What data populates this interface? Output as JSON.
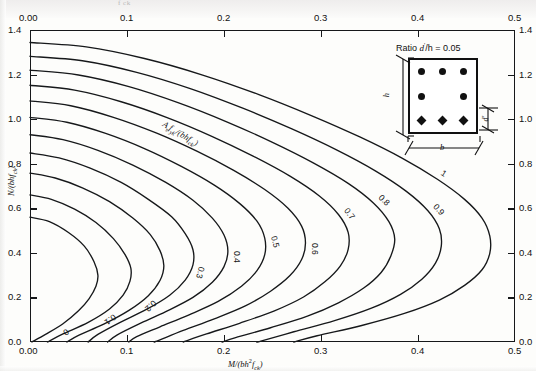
{
  "page": {
    "cut_off_text_top": "f ck"
  },
  "chart_data": {
    "type": "line",
    "title": "",
    "xlabel": "M/(bh²f_ck)",
    "ylabel": "N/(bhf_ck)",
    "xlim": [
      0.0,
      0.5
    ],
    "ylim": [
      0.0,
      1.4
    ],
    "grid": false,
    "legend_position": "inline-curve-labels",
    "x_ticks_bottom": [
      "0.00",
      "0.1",
      "0.2",
      "0.3",
      "0.4",
      "0.5"
    ],
    "x_ticks_top": [
      "0.00",
      "0.1",
      "0.2",
      "0.3",
      "0.4",
      "0.5"
    ],
    "y_ticks_left": [
      "0.0",
      "0.2",
      "0.4",
      "0.6",
      "0.8",
      "1.0",
      "1.2",
      "1.4"
    ],
    "y_ticks_right": [
      "0.0",
      "0.2",
      "0.4",
      "0.6",
      "0.8",
      "1.0",
      "1.2",
      "1.4"
    ],
    "x_tick_values": [
      0.0,
      0.1,
      0.2,
      0.3,
      0.4,
      0.5
    ],
    "y_tick_values": [
      0.0,
      0.2,
      0.4,
      0.6,
      0.8,
      1.0,
      1.2,
      1.4
    ],
    "series_parameter_label": "Asfyk/(bhfck)",
    "series": [
      {
        "name": "0",
        "label": "0",
        "points": [
          [
            0.0,
            0.56
          ],
          [
            0.02,
            0.54
          ],
          [
            0.04,
            0.49
          ],
          [
            0.056,
            0.43
          ],
          [
            0.066,
            0.36
          ],
          [
            0.07,
            0.3
          ],
          [
            0.068,
            0.25
          ],
          [
            0.061,
            0.195
          ],
          [
            0.05,
            0.14
          ],
          [
            0.034,
            0.082
          ],
          [
            0.016,
            0.034
          ],
          [
            0.002,
            0.0
          ]
        ]
      },
      {
        "name": "0.1",
        "label": "0.1",
        "points": [
          [
            0.0,
            0.66
          ],
          [
            0.022,
            0.64
          ],
          [
            0.046,
            0.596
          ],
          [
            0.068,
            0.536
          ],
          [
            0.086,
            0.464
          ],
          [
            0.098,
            0.392
          ],
          [
            0.104,
            0.33
          ],
          [
            0.103,
            0.272
          ],
          [
            0.096,
            0.21
          ],
          [
            0.082,
            0.148
          ],
          [
            0.06,
            0.088
          ],
          [
            0.034,
            0.036
          ],
          [
            0.018,
            0.0
          ]
        ]
      },
      {
        "name": "0.2",
        "label": "0.2",
        "points": [
          [
            0.0,
            0.758
          ],
          [
            0.026,
            0.736
          ],
          [
            0.054,
            0.692
          ],
          [
            0.082,
            0.63
          ],
          [
            0.106,
            0.556
          ],
          [
            0.124,
            0.482
          ],
          [
            0.134,
            0.41
          ],
          [
            0.138,
            0.342
          ],
          [
            0.134,
            0.276
          ],
          [
            0.122,
            0.208
          ],
          [
            0.102,
            0.142
          ],
          [
            0.076,
            0.08
          ],
          [
            0.05,
            0.03
          ],
          [
            0.038,
            0.0
          ]
        ]
      },
      {
        "name": "0.3",
        "label": "0.3",
        "points": [
          [
            0.0,
            0.848
          ],
          [
            0.03,
            0.826
          ],
          [
            0.062,
            0.78
          ],
          [
            0.094,
            0.716
          ],
          [
            0.122,
            0.64
          ],
          [
            0.146,
            0.562
          ],
          [
            0.16,
            0.486
          ],
          [
            0.168,
            0.414
          ],
          [
            0.168,
            0.346
          ],
          [
            0.16,
            0.278
          ],
          [
            0.144,
            0.21
          ],
          [
            0.12,
            0.146
          ],
          [
            0.092,
            0.086
          ],
          [
            0.07,
            0.034
          ],
          [
            0.06,
            0.0
          ]
        ]
      },
      {
        "name": "0.4",
        "label": "0.4",
        "points": [
          [
            0.0,
            0.93
          ],
          [
            0.034,
            0.908
          ],
          [
            0.07,
            0.86
          ],
          [
            0.106,
            0.794
          ],
          [
            0.14,
            0.716
          ],
          [
            0.168,
            0.636
          ],
          [
            0.188,
            0.556
          ],
          [
            0.2,
            0.48
          ],
          [
            0.204,
            0.408
          ],
          [
            0.2,
            0.338
          ],
          [
            0.188,
            0.268
          ],
          [
            0.168,
            0.2
          ],
          [
            0.14,
            0.136
          ],
          [
            0.112,
            0.08
          ],
          [
            0.09,
            0.032
          ],
          [
            0.08,
            0.0
          ]
        ]
      },
      {
        "name": "0.5",
        "label": "0.5",
        "points": [
          [
            0.0,
            1.008
          ],
          [
            0.038,
            0.986
          ],
          [
            0.078,
            0.936
          ],
          [
            0.118,
            0.868
          ],
          [
            0.156,
            0.788
          ],
          [
            0.19,
            0.704
          ],
          [
            0.216,
            0.622
          ],
          [
            0.234,
            0.542
          ],
          [
            0.242,
            0.466
          ],
          [
            0.242,
            0.392
          ],
          [
            0.234,
            0.32
          ],
          [
            0.218,
            0.25
          ],
          [
            0.194,
            0.182
          ],
          [
            0.164,
            0.122
          ],
          [
            0.134,
            0.068
          ],
          [
            0.11,
            0.024
          ],
          [
            0.102,
            0.0
          ]
        ]
      },
      {
        "name": "0.6",
        "label": "0.6",
        "points": [
          [
            0.0,
            1.082
          ],
          [
            0.042,
            1.06
          ],
          [
            0.086,
            1.008
          ],
          [
            0.13,
            0.938
          ],
          [
            0.172,
            0.856
          ],
          [
            0.21,
            0.77
          ],
          [
            0.242,
            0.684
          ],
          [
            0.266,
            0.6
          ],
          [
            0.28,
            0.52
          ],
          [
            0.284,
            0.444
          ],
          [
            0.28,
            0.37
          ],
          [
            0.268,
            0.298
          ],
          [
            0.248,
            0.228
          ],
          [
            0.222,
            0.162
          ],
          [
            0.19,
            0.104
          ],
          [
            0.158,
            0.052
          ],
          [
            0.134,
            0.01
          ],
          [
            0.128,
            0.0
          ]
        ]
      },
      {
        "name": "0.7",
        "label": "0.7",
        "points": [
          [
            0.0,
            1.152
          ],
          [
            0.046,
            1.13
          ],
          [
            0.094,
            1.078
          ],
          [
            0.142,
            1.006
          ],
          [
            0.188,
            0.922
          ],
          [
            0.23,
            0.834
          ],
          [
            0.268,
            0.744
          ],
          [
            0.298,
            0.656
          ],
          [
            0.318,
            0.572
          ],
          [
            0.328,
            0.492
          ],
          [
            0.328,
            0.416
          ],
          [
            0.32,
            0.342
          ],
          [
            0.304,
            0.27
          ],
          [
            0.282,
            0.202
          ],
          [
            0.252,
            0.14
          ],
          [
            0.216,
            0.084
          ],
          [
            0.182,
            0.036
          ],
          [
            0.158,
            0.0
          ]
        ]
      },
      {
        "name": "0.8",
        "label": "0.8",
        "points": [
          [
            0.0,
            1.22
          ],
          [
            0.05,
            1.198
          ],
          [
            0.102,
            1.146
          ],
          [
            0.154,
            1.072
          ],
          [
            0.204,
            0.986
          ],
          [
            0.25,
            0.896
          ],
          [
            0.292,
            0.804
          ],
          [
            0.328,
            0.712
          ],
          [
            0.354,
            0.624
          ],
          [
            0.37,
            0.54
          ],
          [
            0.376,
            0.462
          ],
          [
            0.372,
            0.386
          ],
          [
            0.362,
            0.312
          ],
          [
            0.344,
            0.242
          ],
          [
            0.318,
            0.176
          ],
          [
            0.286,
            0.116
          ],
          [
            0.248,
            0.064
          ],
          [
            0.212,
            0.02
          ],
          [
            0.198,
            0.0
          ]
        ]
      },
      {
        "name": "0.9",
        "label": "0.9",
        "points": [
          [
            0.0,
            1.282
          ],
          [
            0.054,
            1.262
          ],
          [
            0.11,
            1.21
          ],
          [
            0.166,
            1.136
          ],
          [
            0.22,
            1.048
          ],
          [
            0.27,
            0.956
          ],
          [
            0.316,
            0.862
          ],
          [
            0.356,
            0.768
          ],
          [
            0.388,
            0.676
          ],
          [
            0.41,
            0.59
          ],
          [
            0.422,
            0.508
          ],
          [
            0.424,
            0.43
          ],
          [
            0.418,
            0.354
          ],
          [
            0.404,
            0.282
          ],
          [
            0.382,
            0.214
          ],
          [
            0.352,
            0.152
          ],
          [
            0.314,
            0.096
          ],
          [
            0.272,
            0.046
          ],
          [
            0.238,
            0.004
          ],
          [
            0.234,
            0.0
          ]
        ]
      },
      {
        "name": "1",
        "label": "1",
        "points": [
          [
            0.0,
            1.344
          ],
          [
            0.058,
            1.324
          ],
          [
            0.118,
            1.272
          ],
          [
            0.178,
            1.198
          ],
          [
            0.236,
            1.11
          ],
          [
            0.29,
            1.016
          ],
          [
            0.34,
            0.92
          ],
          [
            0.384,
            0.824
          ],
          [
            0.42,
            0.73
          ],
          [
            0.448,
            0.64
          ],
          [
            0.466,
            0.556
          ],
          [
            0.474,
            0.476
          ],
          [
            0.474,
            0.398
          ],
          [
            0.466,
            0.324
          ],
          [
            0.448,
            0.254
          ],
          [
            0.422,
            0.188
          ],
          [
            0.386,
            0.128
          ],
          [
            0.342,
            0.074
          ],
          [
            0.296,
            0.028
          ],
          [
            0.272,
            0.0
          ]
        ]
      }
    ],
    "curve_label_text": [
      "1",
      "0.9",
      "0.8",
      "0.7",
      "0.6",
      "0.5",
      "0.4",
      "0.3",
      "0.2",
      "0.1",
      "0"
    ]
  },
  "inset": {
    "caption": "Ratio d'/h = 0.05",
    "caption_prefix": "Ratio ",
    "caption_symbol_d": "d",
    "caption_prime": "′",
    "caption_mid": "/h = ",
    "caption_value": "0.05",
    "dim_height_label": "h",
    "dim_width_label": "b",
    "dim_cover_label": "d'",
    "bar_rows": [
      {
        "type": "circle",
        "count": 3
      },
      {
        "type": "circle",
        "count": 2
      },
      {
        "type": "diamond",
        "count": 3
      }
    ]
  },
  "axes": {
    "y_label_text": "N/(bhf ck)",
    "x_label_text": "M/(bh2f ck)",
    "series_label_text": "Asfyk/(bhfck)"
  }
}
